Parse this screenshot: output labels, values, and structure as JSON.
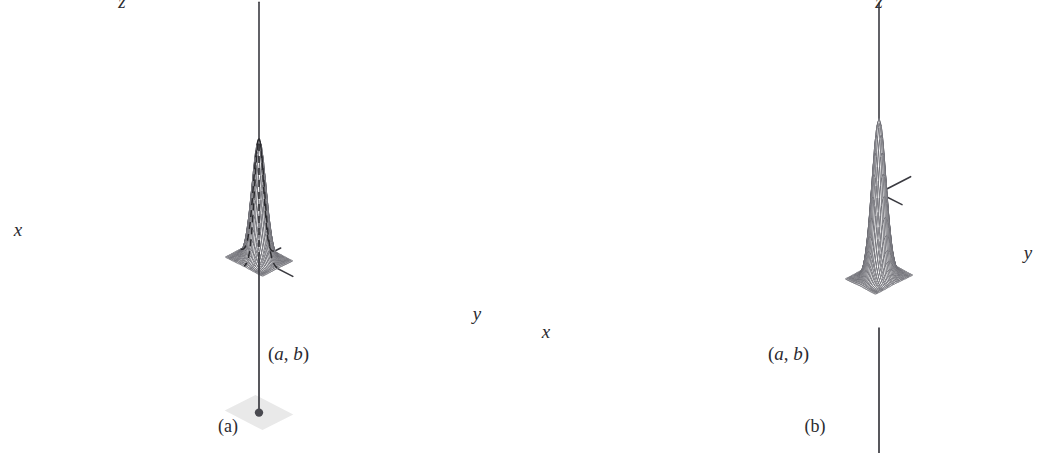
{
  "figure": {
    "background_color": "#ffffff",
    "width": 1043,
    "height": 453
  },
  "style": {
    "axis_color": "#3a3a40",
    "mesh_color": "#6e6e74",
    "mesh_edge_color": "#55555b",
    "dashed_color": "#2b2b2f",
    "plane_fill": "#e9e9e9",
    "dot_color": "#4a4a50",
    "text_color": "#2b2b2f"
  },
  "panels": [
    {
      "id": "a",
      "caption": "(a)",
      "surface_kind": "maximum",
      "axes": [
        {
          "name": "z",
          "label": "z"
        },
        {
          "name": "x",
          "label": "x"
        },
        {
          "name": "y",
          "label": "y"
        }
      ],
      "point": {
        "label_open": "(",
        "label_a": "a",
        "label_sep": ", ",
        "label_b": "b",
        "label_close": ")"
      },
      "base_plane": {
        "shape": "rhombus",
        "shaded": true
      },
      "dashed_guides": [
        "vertical-drop-to-peak",
        "ridge-trace"
      ],
      "drop_line": true
    },
    {
      "id": "b",
      "caption": "(b)",
      "surface_kind": "minimum",
      "axes": [
        {
          "name": "z",
          "label": "z"
        },
        {
          "name": "x",
          "label": "x"
        },
        {
          "name": "y",
          "label": "y"
        }
      ],
      "point": {
        "label_open": "(",
        "label_a": "a",
        "label_sep": ", ",
        "label_b": "b",
        "label_close": ")"
      },
      "base_plane": {
        "shape": "rhombus",
        "shaded": true
      },
      "dashed_guides": [
        "valley-trace"
      ],
      "drop_line": true
    }
  ],
  "chart_data": {
    "type": "line",
    "xlabel": "x",
    "ylabel": "y",
    "zlabel": "z",
    "surfaces": [
      {
        "panel": "a",
        "name": "local maximum",
        "function": "z = A * exp(-((x-a)^2 + (y-b)^2) / s)",
        "amplitude": 1.0,
        "sign": 1,
        "critical_point": {
          "x": "a",
          "y": "b",
          "type": "local maximum"
        },
        "mesh_divisions_u": 30,
        "mesh_divisions_v": 30,
        "domain": {
          "x": [
            -3,
            3
          ],
          "y": [
            -3,
            3
          ]
        },
        "zlim": [
          0,
          1
        ]
      },
      {
        "panel": "b",
        "name": "local minimum",
        "function": "z = -A * exp(-((x-a)^2 + (y-b)^2) / s)",
        "amplitude": 1.0,
        "sign": -1,
        "critical_point": {
          "x": "a",
          "y": "b",
          "type": "local minimum"
        },
        "mesh_divisions_u": 30,
        "mesh_divisions_v": 30,
        "domain": {
          "x": [
            -3,
            3
          ],
          "y": [
            -3,
            3
          ]
        },
        "zlim": [
          -1,
          0
        ]
      }
    ],
    "legend": [],
    "grid": false,
    "annotations": [
      {
        "panel": "a",
        "text": "(a, b)",
        "role": "critical-point-label"
      },
      {
        "panel": "b",
        "text": "(a, b)",
        "role": "critical-point-label"
      },
      {
        "panel": "a",
        "text": "(a)",
        "role": "subfigure-caption"
      },
      {
        "panel": "b",
        "text": "(b)",
        "role": "subfigure-caption"
      }
    ]
  }
}
